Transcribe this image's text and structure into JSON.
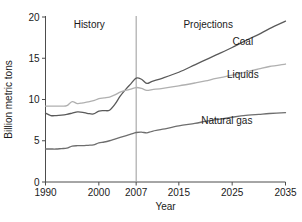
{
  "chart_data": {
    "type": "line",
    "title": "",
    "xlabel": "Year",
    "ylabel": "Billion metric tons",
    "xlim": [
      1990,
      2035
    ],
    "ylim": [
      0,
      20
    ],
    "grid": false,
    "legend_position": "inline-right-labels",
    "xticks": [
      1990,
      2000,
      2007,
      2015,
      2025,
      2035
    ],
    "xticklabels": [
      "1990",
      "2000",
      "2007",
      "2015",
      "2025",
      "2035"
    ],
    "yticks": [
      0,
      5,
      10,
      15,
      20
    ],
    "yticklabels": [
      "0",
      "5",
      "10",
      "15",
      "20"
    ],
    "annotations": [
      {
        "text": "History",
        "x": 1998,
        "y": 19.2
      },
      {
        "text": "Projections",
        "x": 2020,
        "y": 19.2
      },
      {
        "text": "2007 divider",
        "x": 2007,
        "y": 20
      }
    ],
    "series": [
      {
        "name": "Coal",
        "color": "#5a5a5a",
        "label_x": 2027,
        "label_y": 16.6,
        "x": [
          1990,
          1991,
          1992,
          1993,
          1994,
          1995,
          1996,
          1997,
          1998,
          1999,
          2000,
          2001,
          2002,
          2003,
          2004,
          2005,
          2006,
          2007,
          2008,
          2009,
          2010,
          2012,
          2015,
          2018,
          2020,
          2022,
          2025,
          2028,
          2030,
          2032,
          2035
        ],
        "values": [
          8.35,
          8.05,
          8.05,
          8.1,
          8.2,
          8.35,
          8.5,
          8.45,
          8.3,
          8.25,
          8.6,
          8.65,
          8.7,
          9.4,
          10.4,
          11.2,
          11.9,
          12.6,
          12.45,
          11.95,
          12.2,
          12.6,
          13.3,
          14.2,
          14.8,
          15.4,
          16.3,
          17.3,
          17.9,
          18.6,
          19.5
        ]
      },
      {
        "name": "Liquids",
        "color": "#b0b0b0",
        "label_x": 2027,
        "label_y": 12.6,
        "x": [
          1990,
          1991,
          1992,
          1993,
          1994,
          1995,
          1996,
          1997,
          1998,
          1999,
          2000,
          2001,
          2002,
          2003,
          2004,
          2005,
          2006,
          2007,
          2008,
          2009,
          2010,
          2012,
          2015,
          2018,
          2020,
          2022,
          2025,
          2028,
          2030,
          2032,
          2035
        ],
        "values": [
          9.2,
          9.2,
          9.2,
          9.2,
          9.25,
          9.75,
          9.5,
          9.6,
          9.7,
          9.85,
          10.1,
          10.2,
          10.3,
          10.55,
          10.9,
          11.1,
          11.25,
          11.45,
          11.35,
          11.1,
          11.2,
          11.35,
          11.65,
          12.0,
          12.25,
          12.55,
          12.95,
          13.4,
          13.7,
          14.0,
          14.3
        ]
      },
      {
        "name": "Natural gas",
        "color": "#6e6e6e",
        "label_x": 2024,
        "label_y": 7.0,
        "x": [
          1990,
          1991,
          1992,
          1993,
          1994,
          1995,
          1996,
          1997,
          1998,
          1999,
          2000,
          2001,
          2002,
          2003,
          2004,
          2005,
          2006,
          2007,
          2008,
          2009,
          2010,
          2012,
          2015,
          2018,
          2020,
          2022,
          2025,
          2028,
          2030,
          2032,
          2035
        ],
        "values": [
          4.0,
          4.0,
          4.0,
          4.05,
          4.1,
          4.35,
          4.4,
          4.4,
          4.45,
          4.5,
          4.75,
          4.85,
          5.0,
          5.2,
          5.4,
          5.6,
          5.8,
          6.0,
          6.05,
          5.95,
          6.15,
          6.4,
          6.8,
          7.1,
          7.35,
          7.55,
          7.85,
          8.1,
          8.2,
          8.3,
          8.4
        ]
      }
    ]
  },
  "labels": {
    "history": "History",
    "projections": "Projections",
    "y_axis_title": "Billion metric tons",
    "x_axis_title": "Year",
    "coal": "Coal",
    "liquids": "Liquids",
    "natural_gas": "Natural gas"
  },
  "colors": {
    "coal": "#5a5a5a",
    "liquids": "#b0b0b0",
    "natural_gas": "#6e6e6e",
    "axis": "#4d4d4d",
    "divider": "#9a9a9a",
    "background": "#ffffff"
  }
}
